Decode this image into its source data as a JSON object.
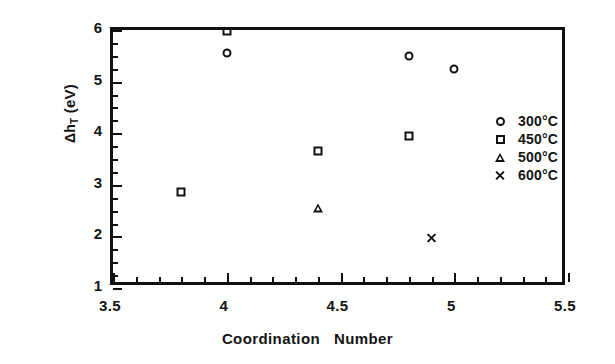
{
  "chart_data": {
    "type": "scatter",
    "title": "",
    "xlabel_part1": "Coordination",
    "xlabel_part2": "Number",
    "ylabel": "Δh",
    "ylabel_sub": "T",
    "ylabel_unit": "(eV)",
    "xlim": [
      3.5,
      5.5
    ],
    "ylim": [
      1,
      6
    ],
    "xticks": [
      "3.5",
      "4",
      "4.5",
      "5",
      "5.5"
    ],
    "xtick_values": [
      3.5,
      4,
      4.5,
      5,
      5.5
    ],
    "yticks": [
      "1",
      "2",
      "3",
      "4",
      "5",
      "6"
    ],
    "ytick_values": [
      1,
      2,
      3,
      4,
      5,
      6
    ],
    "x_minor_step": 0.1,
    "y_minor_step": 0.25,
    "grid": false,
    "legend_position": "right-middle",
    "series": [
      {
        "name": "300°C",
        "marker": "circle",
        "points": [
          {
            "x": 4.0,
            "y": 5.55
          },
          {
            "x": 4.8,
            "y": 5.5
          },
          {
            "x": 5.0,
            "y": 5.25
          }
        ]
      },
      {
        "name": "450°C",
        "marker": "square",
        "points": [
          {
            "x": 3.8,
            "y": 2.87
          },
          {
            "x": 4.0,
            "y": 5.98
          },
          {
            "x": 4.4,
            "y": 3.65
          },
          {
            "x": 4.8,
            "y": 3.95
          }
        ]
      },
      {
        "name": "500°C",
        "marker": "triangle",
        "points": [
          {
            "x": 4.4,
            "y": 2.55
          }
        ]
      },
      {
        "name": "600°C",
        "marker": "cross",
        "points": [
          {
            "x": 4.9,
            "y": 1.97
          }
        ]
      }
    ]
  },
  "legend": {
    "entries": [
      {
        "label": "300°C",
        "marker": "circle"
      },
      {
        "label": "450°C",
        "marker": "square"
      },
      {
        "label": "500°C",
        "marker": "triangle"
      },
      {
        "label": "600°C",
        "marker": "cross"
      }
    ]
  }
}
